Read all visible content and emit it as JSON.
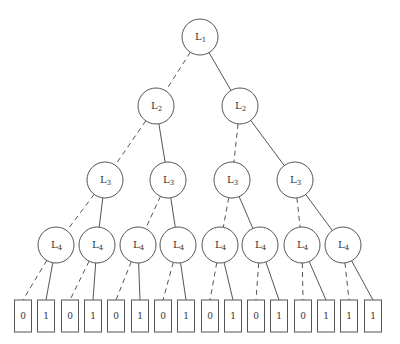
{
  "diagram": {
    "type": "binary-tree",
    "edge_styles": {
      "left": "dashed",
      "right": "solid"
    },
    "nodes": [
      {
        "id": "n1",
        "label": "L",
        "sub": "1",
        "x": 200,
        "y": 37
      },
      {
        "id": "n2a",
        "label": "L",
        "sub": "2",
        "x": 156,
        "y": 106
      },
      {
        "id": "n2b",
        "label": "L",
        "sub": "2",
        "x": 240,
        "y": 106
      },
      {
        "id": "n3a",
        "label": "L",
        "sub": "3",
        "x": 105,
        "y": 180
      },
      {
        "id": "n3b",
        "label": "L",
        "sub": "3",
        "x": 168,
        "y": 180
      },
      {
        "id": "n3c",
        "label": "L",
        "sub": "3",
        "x": 232,
        "y": 180
      },
      {
        "id": "n3d",
        "label": "L",
        "sub": "3",
        "x": 295,
        "y": 180
      },
      {
        "id": "n4a",
        "label": "L",
        "sub": "4",
        "x": 56,
        "y": 245
      },
      {
        "id": "n4b",
        "label": "L",
        "sub": "4",
        "x": 97,
        "y": 245
      },
      {
        "id": "n4c",
        "label": "L",
        "sub": "4",
        "x": 138,
        "y": 245
      },
      {
        "id": "n4d",
        "label": "L",
        "sub": "4",
        "x": 178,
        "y": 245
      },
      {
        "id": "n4e",
        "label": "L",
        "sub": "4",
        "x": 220,
        "y": 245
      },
      {
        "id": "n4f",
        "label": "L",
        "sub": "4",
        "x": 260,
        "y": 245
      },
      {
        "id": "n4g",
        "label": "L",
        "sub": "4",
        "x": 302,
        "y": 245
      },
      {
        "id": "n4h",
        "label": "L",
        "sub": "4",
        "x": 343,
        "y": 245
      }
    ],
    "leaves": [
      {
        "value": "0",
        "x": 23
      },
      {
        "value": "1",
        "x": 46
      },
      {
        "value": "0",
        "x": 70
      },
      {
        "value": "1",
        "x": 93
      },
      {
        "value": "0",
        "x": 116
      },
      {
        "value": "1",
        "x": 140
      },
      {
        "value": "0",
        "x": 163
      },
      {
        "value": "1",
        "x": 186
      },
      {
        "value": "0",
        "x": 210
      },
      {
        "value": "1",
        "x": 233
      },
      {
        "value": "0",
        "x": 256
      },
      {
        "value": "1",
        "x": 279
      },
      {
        "value": "0",
        "x": 303
      },
      {
        "value": "1",
        "x": 326
      },
      {
        "value": "1",
        "x": 349
      },
      {
        "value": "1",
        "x": 373
      }
    ],
    "node_radius": 18,
    "leaf_box": {
      "top": 300,
      "width": 17,
      "height": 32
    }
  }
}
